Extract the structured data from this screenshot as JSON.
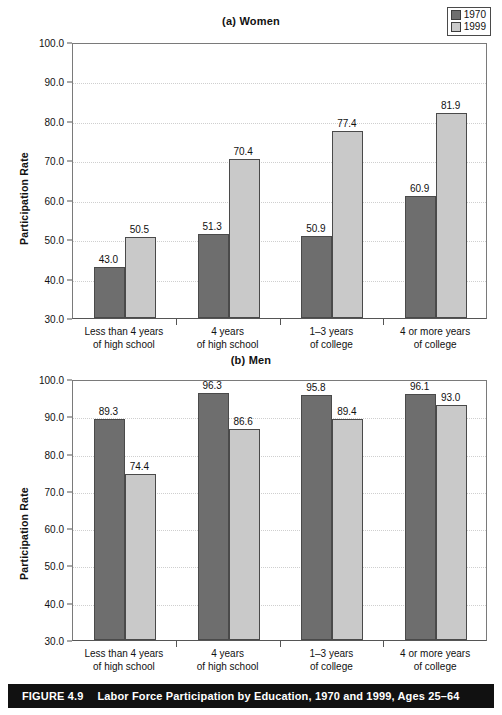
{
  "figure": {
    "caption_number": "FIGURE 4.9",
    "caption_text": "Labor Force Participation by Education, 1970 and 1999, Ages 25–64"
  },
  "legend": {
    "series": [
      {
        "label": "1970",
        "color": "#6e6e6e"
      },
      {
        "label": "1999",
        "color": "#c9c9c9"
      }
    ]
  },
  "chart_data": [
    {
      "type": "bar",
      "title": "(a) Women",
      "xlabel": "",
      "ylabel": "Participation Rate",
      "ylim": [
        30.0,
        100.0
      ],
      "yticks": [
        "30.0",
        "40.0",
        "50.0",
        "60.0",
        "70.0",
        "80.0",
        "90.0",
        "100.0"
      ],
      "grid": true,
      "legend_position": "top-right",
      "categories": [
        "Less than 4 years\nof high school",
        "4 years\nof high school",
        "1–3 years\nof college",
        "4 or more years\nof college"
      ],
      "category_lines": [
        [
          "Less than 4 years",
          "of high school"
        ],
        [
          "4 years",
          "of high school"
        ],
        [
          "1–3 years",
          "of college"
        ],
        [
          "4 or more years",
          "of college"
        ]
      ],
      "series": [
        {
          "name": "1970",
          "values": [
            43.0,
            51.3,
            50.9,
            60.9
          ],
          "labels": [
            "43.0",
            "51.3",
            "50.9",
            "60.9"
          ]
        },
        {
          "name": "1999",
          "values": [
            50.5,
            70.4,
            77.4,
            81.9
          ],
          "labels": [
            "50.5",
            "70.4",
            "77.4",
            "81.9"
          ]
        }
      ]
    },
    {
      "type": "bar",
      "title": "(b) Men",
      "xlabel": "",
      "ylabel": "Participation Rate",
      "ylim": [
        30.0,
        100.0
      ],
      "yticks": [
        "30.0",
        "40.0",
        "50.0",
        "60.0",
        "70.0",
        "80.0",
        "90.0",
        "100.0"
      ],
      "grid": true,
      "legend_position": "none",
      "categories": [
        "Less than 4 years\nof high school",
        "4 years\nof high school",
        "1–3 years\nof college",
        "4 or more years\nof college"
      ],
      "category_lines": [
        [
          "Less than 4 years",
          "of high school"
        ],
        [
          "4 years",
          "of high school"
        ],
        [
          "1–3 years",
          "of college"
        ],
        [
          "4 or more years",
          "of college"
        ]
      ],
      "series": [
        {
          "name": "1970",
          "values": [
            89.3,
            96.3,
            95.8,
            96.1
          ],
          "labels": [
            "89.3",
            "96.3",
            "95.8",
            "96.1"
          ]
        },
        {
          "name": "1999",
          "values": [
            74.4,
            86.6,
            89.4,
            93.0
          ],
          "labels": [
            "74.4",
            "86.6",
            "89.4",
            "93.0"
          ]
        }
      ]
    }
  ]
}
